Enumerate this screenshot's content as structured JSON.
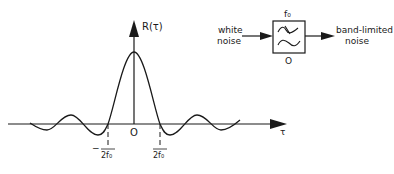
{
  "plot": {
    "y_axis_label": "R(τ)",
    "x_axis_label": "τ",
    "origin_label": "O",
    "tick_left": {
      "sign": "−",
      "numerator": "1",
      "denominator": "2f₀"
    },
    "tick_right": {
      "numerator": "1",
      "denominator": "2f₀"
    },
    "curve": "sinc-shaped autocorrelation with main lobe centered at origin"
  },
  "block_diagram": {
    "input_label_line1": "white",
    "input_label_line2": "noise",
    "filter_top_label": "f₀",
    "filter_bottom_label": "O",
    "filter_icon": "bandpass-filter-icon",
    "output_label_line1": "band-limited",
    "output_label_line2": "noise"
  },
  "colors": {
    "ink": "#1a1a1a",
    "background": "#ffffff"
  }
}
